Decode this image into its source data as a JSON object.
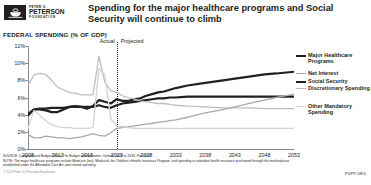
{
  "brand": {
    "line1": "PETER G.",
    "line2": "PETERSON",
    "line3": "FOUNDATION",
    "logo_icon": "peterson-bowl-logo"
  },
  "header": {
    "title": "Spending for the major healthcare programs and Social Security will continue to climb"
  },
  "axis_title": "FEDERAL SPENDING (% OF GDP)",
  "annotations": {
    "actual": "Actual",
    "projected": "Projected",
    "divider_year": 2023
  },
  "footer": {
    "source": "SOURCE: Congressional Budget Office, The Budget and Economic Outlook: 2023 to 2033, Feb 2023.",
    "note": "NOTE: The major healthcare programs include Medicare (net), Medicaid, the Children's Health Insurance Program, and spending to subsidize health insurance purchased through the marketplaces established under the Affordable Care Act and related spending.",
    "copyright": "© 2023 Peter G. Peterson Foundation",
    "tag": "PGPF.ORG"
  },
  "colors": {
    "major_healthcare": "#231f20",
    "net_interest": "#a7a9ac",
    "social_security": "#231f20",
    "discretionary": "#bcbec0",
    "other_mandatory": "#d1d3d4",
    "axis": "#8c8c8c",
    "text": "#231f20"
  },
  "chart_data": {
    "type": "line",
    "title": "Spending for the major healthcare programs and Social Security will continue to climb",
    "xlabel": "",
    "ylabel": "Federal Spending (% of GDP)",
    "xlim": [
      2008,
      2053
    ],
    "ylim": [
      0,
      12
    ],
    "ytick_labels": [
      "0%",
      "2%",
      "4%",
      "6%",
      "8%",
      "10%",
      "12%"
    ],
    "yticks": [
      0,
      2,
      4,
      6,
      8,
      10,
      12
    ],
    "xticks": [
      2008,
      2013,
      2018,
      2023,
      2028,
      2033,
      2038,
      2043,
      2048,
      2053
    ],
    "grid": false,
    "legend_position": "right",
    "x": [
      2008,
      2009,
      2010,
      2011,
      2012,
      2013,
      2014,
      2015,
      2016,
      2017,
      2018,
      2019,
      2020,
      2021,
      2022,
      2023,
      2024,
      2025,
      2026,
      2027,
      2028,
      2029,
      2030,
      2031,
      2032,
      2033,
      2035,
      2038,
      2041,
      2043,
      2046,
      2048,
      2050,
      2053
    ],
    "series": [
      {
        "name": "Major Healthcare Programs",
        "color": "#231f20",
        "width": 2.2,
        "values": [
          3.9,
          4.6,
          4.6,
          4.5,
          4.3,
          4.3,
          4.6,
          4.9,
          5.0,
          4.9,
          4.7,
          5.0,
          5.7,
          5.5,
          5.3,
          5.8,
          5.6,
          5.6,
          5.8,
          5.9,
          6.2,
          6.4,
          6.6,
          6.7,
          6.9,
          7.1,
          7.4,
          7.7,
          8.0,
          8.2,
          8.5,
          8.7,
          8.8,
          9.0
        ]
      },
      {
        "name": "Social Security",
        "color": "#231f20",
        "width": 2.2,
        "values": [
          4.1,
          4.6,
          4.7,
          4.7,
          4.8,
          4.8,
          4.8,
          4.9,
          4.9,
          4.9,
          4.9,
          4.9,
          5.1,
          4.9,
          4.8,
          5.1,
          5.3,
          5.4,
          5.5,
          5.6,
          5.7,
          5.8,
          5.9,
          5.9,
          6.0,
          6.0,
          6.1,
          6.1,
          6.1,
          6.1,
          6.1,
          6.1,
          6.1,
          6.1
        ]
      },
      {
        "name": "Discretionary Spending",
        "color": "#bcbec0",
        "width": 1.3,
        "values": [
          7.4,
          8.6,
          8.8,
          8.7,
          8.0,
          7.2,
          6.9,
          6.6,
          6.5,
          6.3,
          6.3,
          6.3,
          10.8,
          7.8,
          6.8,
          6.6,
          6.2,
          6.0,
          5.8,
          5.6,
          5.5,
          5.4,
          5.3,
          5.3,
          5.2,
          5.1,
          5.0,
          4.9,
          4.8,
          4.8,
          4.8,
          4.7,
          4.7,
          4.7
        ]
      },
      {
        "name": "Net Interest",
        "color": "#a7a9ac",
        "width": 1.3,
        "values": [
          1.7,
          1.3,
          1.3,
          1.5,
          1.4,
          1.3,
          1.3,
          1.2,
          1.3,
          1.4,
          1.6,
          1.8,
          1.6,
          1.5,
          1.9,
          2.4,
          2.5,
          2.6,
          2.7,
          2.8,
          2.9,
          3.0,
          3.1,
          3.2,
          3.3,
          3.4,
          3.7,
          4.2,
          4.6,
          4.9,
          5.4,
          5.7,
          6.0,
          6.4
        ]
      },
      {
        "name": "Other Mandatory Spending",
        "color": "#d1d3d4",
        "width": 1.3,
        "values": [
          2.4,
          4.5,
          3.9,
          3.3,
          2.8,
          2.6,
          2.5,
          2.5,
          2.4,
          2.4,
          2.4,
          2.5,
          9.4,
          8.6,
          3.5,
          2.7,
          2.6,
          2.5,
          2.4,
          2.4,
          2.4,
          2.4,
          2.4,
          2.4,
          2.4,
          2.4,
          2.4,
          2.4,
          2.4,
          2.4,
          2.4,
          2.4,
          2.4,
          2.4
        ]
      }
    ]
  },
  "legend": [
    {
      "label": "Major Healthcare Programs",
      "color": "#231f20"
    },
    {
      "label": "Net Interest",
      "color": "#a7a9ac"
    },
    {
      "label": "Social Security",
      "color": "#231f20"
    },
    {
      "label": "Discretionary Spending",
      "color": "#bcbec0"
    },
    {
      "label": "Other Mandatory Spending",
      "color": "#d1d3d4"
    }
  ]
}
